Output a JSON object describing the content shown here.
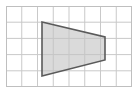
{
  "figure": {
    "kind": "geometry-figure",
    "background_color": "#ffffff",
    "canvas": {
      "width": 139,
      "height": 93
    }
  },
  "grid": {
    "name": "square-grid",
    "columns": 8,
    "rows": 5,
    "origin_x": 6,
    "origin_y": 6,
    "cell_width": 15.75,
    "cell_height": 16.2,
    "line_color": "#c9c9c9",
    "border_color": "#bfbfbf",
    "line_width": 1,
    "visible": true
  },
  "shape": {
    "name": "trapezoid",
    "type": "polygon",
    "sides": 4,
    "fill_color": "#c4c4c4",
    "fill_opacity": 0.62,
    "stroke_color": "#5a5a5a",
    "stroke_width": 1.6,
    "vertices": [
      {
        "label": "top-left",
        "x": 42,
        "y": 22
      },
      {
        "label": "top-right",
        "x": 105,
        "y": 37
      },
      {
        "label": "bottom-right",
        "x": 105,
        "y": 60
      },
      {
        "label": "bottom-left",
        "x": 42,
        "y": 76
      }
    ],
    "points_attr": "42,22 105,37 105,60 42,76"
  },
  "chart_data": {
    "type": "scatter",
    "title": "",
    "xlabel": "",
    "ylabel": "",
    "xlim": [
      0,
      8
    ],
    "ylim": [
      0,
      5
    ],
    "grid": true,
    "legend": "none",
    "series": [
      {
        "name": "trapezoid",
        "closed": true,
        "x": [
          2.29,
          6.29,
          6.29,
          2.29
        ],
        "y": [
          4.01,
          3.09,
          1.67,
          0.68
        ]
      }
    ],
    "annotations": []
  }
}
